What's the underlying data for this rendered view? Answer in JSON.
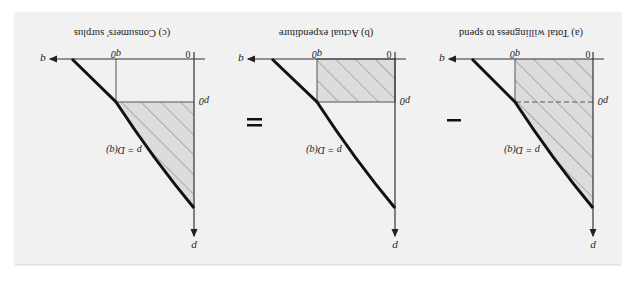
{
  "figure": {
    "orientation": "rotated-180",
    "top_strip_text": "",
    "colors": {
      "background": "#f1f1f1",
      "axis": "#333333",
      "curve": "#111111",
      "hatch_fill": "#dcdcdc",
      "hatch_line": "#7a7a7a"
    },
    "operators": [
      "−",
      "="
    ],
    "panels": [
      {
        "id": "a",
        "caption": "(a) Total willingness to spend",
        "x_axis_label": "q",
        "y_axis_label": "p",
        "origin_label": "0",
        "q0_label": "q0",
        "p0_label": "p0",
        "curve_label": "p = D(q)",
        "shaded_region": "area under demand curve from 0 to q0 (trapezoid)",
        "p0_line_style": "dashed"
      },
      {
        "id": "b",
        "caption": "(b) Actual expenditure",
        "x_axis_label": "q",
        "y_axis_label": "p",
        "origin_label": "0",
        "q0_label": "q0",
        "p0_label": "p0",
        "curve_label": "p = D(q)",
        "shaded_region": "rectangle p0 × q0",
        "p0_line_style": "solid"
      },
      {
        "id": "c",
        "caption": "(c) Consumers' surplus",
        "x_axis_label": "q",
        "y_axis_label": "p",
        "origin_label": "0",
        "q0_label": "q0",
        "p0_label": "p0",
        "curve_label": "p = D(q)",
        "shaded_region": "area between demand curve and p0 from 0 to q0",
        "p0_line_style": "solid"
      }
    ]
  }
}
